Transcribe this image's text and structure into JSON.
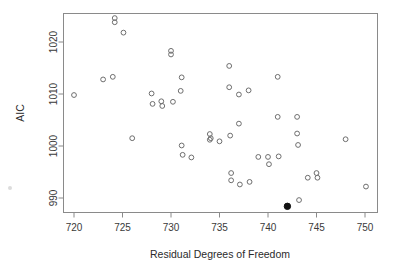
{
  "chart_data": {
    "type": "scatter",
    "title": "",
    "xlabel": "Residual Degrees of Freedom",
    "ylabel": "AIC",
    "xlim": [
      718.5,
      751.5
    ],
    "ylim": [
      987.0,
      1025.5
    ],
    "xticks": [
      720,
      725,
      730,
      735,
      740,
      745,
      750
    ],
    "xtick_labels": [
      "720",
      "725",
      "730",
      "735",
      "740",
      "745",
      "750"
    ],
    "yticks": [
      990,
      1000,
      1010,
      1020
    ],
    "ytick_labels": [
      "990",
      "1000",
      "1010",
      "1020"
    ],
    "grid": false,
    "legend": null,
    "series": [
      {
        "name": "models",
        "marker": "open-circle",
        "color": "#6e6e6e",
        "points": [
          [
            720.0,
            1009.8
          ],
          [
            723.0,
            1012.8
          ],
          [
            724.0,
            1013.3
          ],
          [
            724.2,
            1024.6
          ],
          [
            724.2,
            1023.8
          ],
          [
            725.1,
            1021.8
          ],
          [
            726.0,
            1001.5
          ],
          [
            728.0,
            1010.1
          ],
          [
            728.1,
            1008.1
          ],
          [
            729.0,
            1008.6
          ],
          [
            729.1,
            1007.7
          ],
          [
            730.0,
            1017.6
          ],
          [
            730.0,
            1018.3
          ],
          [
            730.2,
            1008.5
          ],
          [
            731.0,
            1010.6
          ],
          [
            731.1,
            1013.2
          ],
          [
            731.1,
            1000.1
          ],
          [
            731.2,
            998.3
          ],
          [
            732.1,
            997.8
          ],
          [
            734.0,
            1002.3
          ],
          [
            734.0,
            1001.2
          ],
          [
            734.1,
            1001.5
          ],
          [
            735.0,
            1000.9
          ],
          [
            736.0,
            1015.4
          ],
          [
            736.0,
            1011.3
          ],
          [
            736.1,
            1002.0
          ],
          [
            736.2,
            994.8
          ],
          [
            736.2,
            993.4
          ],
          [
            737.0,
            1004.3
          ],
          [
            737.0,
            1009.9
          ],
          [
            737.1,
            992.6
          ],
          [
            738.0,
            1010.7
          ],
          [
            738.1,
            993.1
          ],
          [
            739.0,
            997.9
          ],
          [
            740.0,
            997.9
          ],
          [
            740.1,
            996.5
          ],
          [
            741.0,
            1013.3
          ],
          [
            741.0,
            1005.6
          ],
          [
            741.1,
            998.0
          ],
          [
            743.0,
            1005.6
          ],
          [
            743.0,
            1002.4
          ],
          [
            743.1,
            1000.2
          ],
          [
            743.2,
            989.6
          ],
          [
            744.1,
            993.9
          ],
          [
            745.0,
            994.8
          ],
          [
            745.1,
            993.9
          ],
          [
            748.0,
            1001.3
          ],
          [
            750.1,
            992.2
          ]
        ]
      },
      {
        "name": "selected-model",
        "marker": "filled-circle",
        "color": "#121212",
        "points": [
          [
            742.0,
            988.4
          ]
        ]
      }
    ]
  },
  "axes": {
    "x_title": "Residual Degrees of Freedom",
    "y_title": "AIC"
  }
}
